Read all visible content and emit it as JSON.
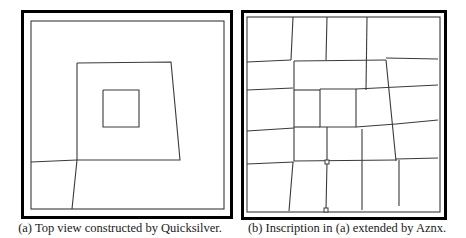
{
  "figure": {
    "panels": [
      {
        "id": "a",
        "caption": "(a) Top view constructed by Quicksilver.",
        "outer_frame": {
          "x": 21,
          "y": 10,
          "w": 212,
          "h": 209,
          "stroke": "#000000",
          "stroke_width": 3
        },
        "inner_frame": {
          "x": 31,
          "y": 21,
          "w": 193,
          "h": 188
        },
        "line_color": "#3a3a3a",
        "polylines": [
          [
            [
              77,
              63
            ],
            [
              171,
              62
            ],
            [
              180,
              160
            ],
            [
              77,
              160
            ],
            [
              77,
              63
            ]
          ],
          [
            [
              103,
              90
            ],
            [
              139,
              90
            ],
            [
              139,
              127
            ],
            [
              103,
              127
            ],
            [
              103,
              90
            ]
          ],
          [
            [
              31,
              162
            ],
            [
              77,
              160
            ]
          ],
          [
            [
              77,
              160
            ],
            [
              72,
              209
            ]
          ]
        ],
        "markers": []
      },
      {
        "id": "b",
        "caption": "(b) Inscription in (a) extended by Aznx.",
        "outer_frame": {
          "x": 241,
          "y": 10,
          "w": 206,
          "h": 210,
          "stroke": "#000000",
          "stroke_width": 3
        },
        "inner_frame": {
          "x": 247,
          "y": 17,
          "w": 193,
          "h": 195
        },
        "line_color": "#3a3a3a",
        "polylines": [
          [
            [
              293,
              17
            ],
            [
              291,
              60
            ]
          ],
          [
            [
              247,
              62
            ],
            [
              291,
              60
            ]
          ],
          [
            [
              327,
              17
            ],
            [
              326,
              60
            ]
          ],
          [
            [
              367,
              17
            ],
            [
              366,
              90
            ]
          ],
          [
            [
              294,
              61
            ],
            [
              386,
              60
            ]
          ],
          [
            [
              386,
              58
            ],
            [
              438,
              59
            ]
          ],
          [
            [
              247,
              90
            ],
            [
              293,
              88
            ]
          ],
          [
            [
              294,
              61
            ],
            [
              294,
              161
            ]
          ],
          [
            [
              386,
              60
            ],
            [
              396,
              161
            ]
          ],
          [
            [
              294,
              90
            ],
            [
              320,
              90
            ]
          ],
          [
            [
              356,
              89
            ],
            [
              438,
              85
            ]
          ],
          [
            [
              320,
              89
            ],
            [
              356,
              89
            ],
            [
              356,
              127
            ],
            [
              320,
              127
            ],
            [
              320,
              89
            ]
          ],
          [
            [
              247,
              131
            ],
            [
              294,
              128
            ]
          ],
          [
            [
              294,
              127
            ],
            [
              320,
              127
            ]
          ],
          [
            [
              356,
              127
            ],
            [
              396,
              124
            ]
          ],
          [
            [
              396,
              124
            ],
            [
              438,
              120
            ]
          ],
          [
            [
              327,
              127
            ],
            [
              327,
              161
            ]
          ],
          [
            [
              362,
              129
            ],
            [
              362,
              210
            ]
          ],
          [
            [
              247,
              164
            ],
            [
              294,
              162
            ]
          ],
          [
            [
              294,
              161
            ],
            [
              396,
              160
            ]
          ],
          [
            [
              396,
              159
            ],
            [
              438,
              158
            ]
          ],
          [
            [
              293,
              162
            ],
            [
              289,
              211
            ]
          ],
          [
            [
              327,
              162
            ],
            [
              326,
              210
            ]
          ],
          [
            [
              399,
              160
            ],
            [
              399,
              206
            ]
          ]
        ],
        "markers": [
          {
            "x": 327,
            "y": 162,
            "size": 4
          },
          {
            "x": 326,
            "y": 210,
            "size": 4
          }
        ]
      }
    ]
  }
}
